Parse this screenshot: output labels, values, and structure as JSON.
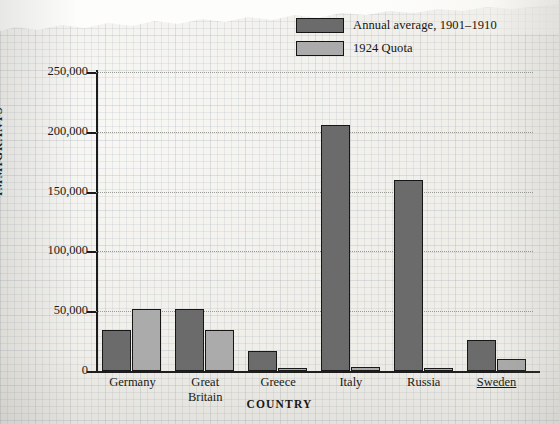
{
  "chart_data": {
    "type": "bar",
    "title": "",
    "xlabel": "COUNTRY",
    "ylabel": "IMMIGRANTS",
    "ylim": [
      0,
      250000
    ],
    "yticks": [
      "0",
      "50,000",
      "100,000",
      "150,000",
      "200,000",
      "250,000"
    ],
    "ytick_values": [
      0,
      50000,
      100000,
      150000,
      200000,
      250000
    ],
    "grid": true,
    "legend_position": "top-right",
    "categories": [
      "Germany",
      "Great Britain",
      "Greece",
      "Italy",
      "Russia",
      "Sweden"
    ],
    "series": [
      {
        "name": "Annual average, 1901–1910",
        "color": "#6b6b6b",
        "values": [
          34000,
          52000,
          17000,
          206000,
          160000,
          26000
        ]
      },
      {
        "name": "1924 Quota",
        "color": "#ababab",
        "values": [
          52000,
          34000,
          2000,
          3000,
          2000,
          10000
        ]
      }
    ]
  },
  "legend": {
    "items": [
      {
        "label": "Annual average, 1901–1910",
        "color": "#6b6b6b"
      },
      {
        "label": "1924 Quota",
        "color": "#ababab"
      }
    ]
  },
  "axes": {
    "y_title": "IMMIGRANTS",
    "x_title": "COUNTRY",
    "y_ticks": [
      "250,000",
      "200,000",
      "150,000",
      "100,000",
      "50,000",
      "0"
    ]
  },
  "x_categories": [
    {
      "line1": "Germany",
      "line2": "",
      "underline": false
    },
    {
      "line1": "Great",
      "line2": "Britain",
      "underline": false
    },
    {
      "line1": "Greece",
      "line2": "",
      "underline": false
    },
    {
      "line1": "Italy",
      "line2": "",
      "underline": false
    },
    {
      "line1": "Russia",
      "line2": "",
      "underline": false
    },
    {
      "line1": "Sweden",
      "line2": "",
      "underline": true
    }
  ],
  "colors": {
    "bar_dark": "#6b6b6b",
    "bar_light": "#ababab",
    "ink": "#16150f",
    "paper": "#efeee9"
  }
}
